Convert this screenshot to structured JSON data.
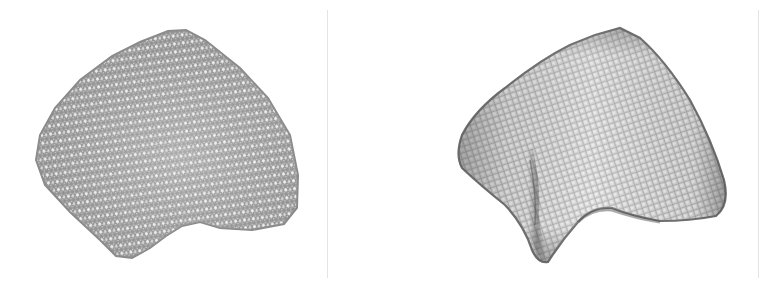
{
  "figure": {
    "panels": [
      {
        "id": "left",
        "description": "Irregular triangulated mesh (input surface)",
        "mesh_type": "triangle-mesh",
        "caption": ""
      },
      {
        "id": "right",
        "description": "Regular quad-grid remeshed surface with fold",
        "mesh_type": "quad-mesh",
        "caption": ""
      }
    ],
    "colors": {
      "background": "#ffffff",
      "mesh_fill": "#c4c4c4",
      "mesh_line": "#8a8a8a",
      "mesh_shadow": "#5a5a5a",
      "divider": "#e4e4e4"
    }
  }
}
